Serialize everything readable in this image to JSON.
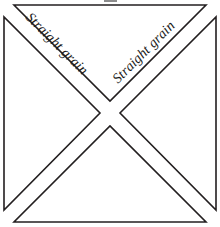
{
  "figure": {
    "name": "quarter-square-triangle-block",
    "background_color": "#ffffff",
    "line_color": "#231f20",
    "fill_color": "#ffffff",
    "line_width_px": 1.6,
    "canvas": {
      "width": 220,
      "height": 227
    }
  },
  "labels": {
    "left_grain": "Straight grain",
    "right_grain": "Straight grain",
    "left_grain_rotation_deg": 45,
    "right_grain_rotation_deg": -45
  },
  "pieces": [
    {
      "name": "top-triangle",
      "points": "14,5 206,5 110,101"
    },
    {
      "name": "left-triangle",
      "points": "4,17 4,210 100,113"
    },
    {
      "name": "right-triangle",
      "points": "216,17 216,210 120,113"
    },
    {
      "name": "bottom-triangle",
      "points": "14,222 206,222 110,126"
    }
  ],
  "crop_mark": {
    "name": "top-crop-mark",
    "x": 104,
    "y": 0,
    "width": 13,
    "height": 2,
    "color": "#8c8c8c"
  }
}
